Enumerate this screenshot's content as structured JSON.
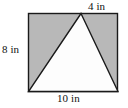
{
  "figure": {
    "kind": "geometry-diagram",
    "colors": {
      "background": "#ffffff",
      "rectangle_fill": "#b8b8b8",
      "triangle_fill": "#fdfdfd",
      "stroke": "#1a1a1a"
    },
    "shapes": {
      "rectangle": {
        "name": "rectangle",
        "x": 28,
        "y": 13,
        "width": 90,
        "height": 79
      },
      "triangle": {
        "name": "inscribed-triangle",
        "apex": [
          81,
          13
        ],
        "base_left": [
          28,
          92
        ],
        "base_right": [
          118,
          92
        ]
      }
    },
    "labels": {
      "top": "4 in",
      "left": "8 in",
      "bottom": "10 in"
    },
    "measurements": {
      "top_segment_in": 4,
      "height_in": 8,
      "base_in": 10,
      "unit": "in"
    }
  }
}
